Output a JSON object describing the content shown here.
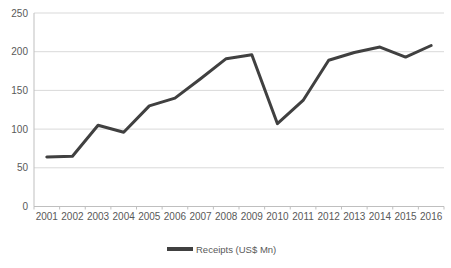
{
  "chart_data": {
    "type": "line",
    "title": "",
    "xlabel": "",
    "ylabel": "",
    "categories": [
      "2001",
      "2002",
      "2003",
      "2004",
      "2005",
      "2006",
      "2007",
      "2008",
      "2009",
      "2010",
      "2011",
      "2012",
      "2013",
      "2014",
      "2015",
      "2016"
    ],
    "series": [
      {
        "name": "Receipts (US$ Mn)",
        "values": [
          64,
          65,
          105,
          96,
          130,
          140,
          165,
          191,
          196,
          107,
          137,
          189,
          199,
          206,
          193,
          208
        ]
      }
    ],
    "legend": [
      "Receipts (US$ Mn)"
    ],
    "legend_position": "bottom-center",
    "ylim": [
      0,
      250
    ],
    "yticks": [
      0,
      50,
      100,
      150,
      200,
      250
    ],
    "grid": "horizontal",
    "colors": {
      "line": "#404040",
      "gridline": "#d9d9d9",
      "axis": "#bfbfbf",
      "text": "#595959",
      "background": "#ffffff"
    }
  }
}
